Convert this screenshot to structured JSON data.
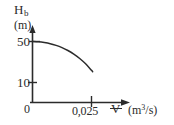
{
  "figure": {
    "background": "#ffffff",
    "ink": "#2b2b2b"
  },
  "axes": {
    "y_title": "H",
    "y_title_sub": "b",
    "y_unit": "(m)",
    "x_symbol": "V",
    "x_unit_pre": "(m",
    "x_unit_sup": "3",
    "x_unit_post": "/s)",
    "origin_label": "0",
    "y_ticks": [
      "50",
      "10"
    ],
    "x_ticks": [
      "0,025"
    ]
  },
  "chart_data": {
    "type": "line",
    "title": "",
    "xlabel": "V (m³/s)",
    "ylabel": "H_b (m)",
    "xlim": [
      0,
      0.0325
    ],
    "ylim": [
      0,
      58
    ],
    "grid": false,
    "legend": null,
    "x_tick_values": [
      0,
      0.025
    ],
    "x_tick_labels": [
      "0",
      "0,025"
    ],
    "y_tick_values": [
      10,
      50
    ],
    "y_tick_labels": [
      "10",
      "50"
    ],
    "series": [
      {
        "name": "Pump head curve",
        "x": [
          0.0,
          0.0025,
          0.005,
          0.0075,
          0.01,
          0.0125,
          0.015,
          0.0175,
          0.02,
          0.0225,
          0.025,
          0.0255
        ],
        "y": [
          50.0,
          49.7,
          49.0,
          47.9,
          46.2,
          44.0,
          41.2,
          37.7,
          33.4,
          28.2,
          21.9,
          20.5
        ]
      }
    ]
  }
}
